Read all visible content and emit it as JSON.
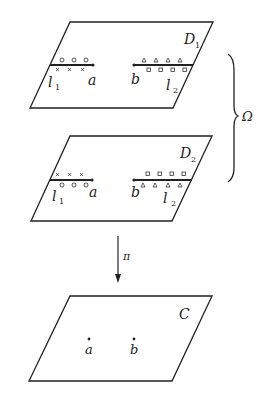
{
  "diagram": {
    "sheets": [
      {
        "id": "D1",
        "label": "D",
        "subscript": "1",
        "cuts": [
          {
            "label": "l",
            "subscript": "1",
            "endpoint": "a",
            "above_marks": "circles",
            "below_marks": "crosses"
          },
          {
            "label": "l",
            "subscript": "2",
            "endpoint": "b",
            "above_marks": "triangles",
            "below_marks": "squares"
          }
        ]
      },
      {
        "id": "D2",
        "label": "D",
        "subscript": "2",
        "cuts": [
          {
            "label": "l",
            "subscript": "1",
            "endpoint": "a",
            "above_marks": "crosses",
            "below_marks": "circles"
          },
          {
            "label": "l",
            "subscript": "2",
            "endpoint": "b",
            "above_marks": "squares",
            "below_marks": "triangles"
          }
        ]
      }
    ],
    "surface_label": "Ω",
    "projection_label": "π",
    "base": {
      "label": "C",
      "points": [
        "a",
        "b"
      ]
    },
    "point_a": "a",
    "point_b": "b",
    "cut_l": "l",
    "sub1": "1",
    "sub2": "2"
  }
}
